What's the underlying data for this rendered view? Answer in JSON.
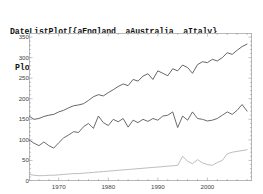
{
  "notebook": {
    "input_code_lines": [
      "DateListPlot[{aEngland, aAustralia, aItaly},",
      "PlotStyle → {Red, Green, Blue}, Joined → True]"
    ],
    "function_name": "DateListPlot",
    "series_symbols": [
      "aEngland",
      "aAustralia",
      "aItaly"
    ],
    "plot_style_colors": [
      "Red",
      "Green",
      "Blue"
    ],
    "joined_option": "True"
  },
  "chart_data": {
    "type": "line",
    "title": "",
    "xlabel": "",
    "ylabel": "",
    "xlim": [
      1964,
      2009
    ],
    "ylim": [
      0,
      360
    ],
    "grid": false,
    "legend_position": "none",
    "yticks": [
      0,
      50,
      100,
      150,
      200,
      250,
      300,
      350
    ],
    "ytick_labels": [
      "0",
      "50",
      "100",
      "150",
      "200",
      "250",
      "300",
      "350"
    ],
    "xticks": [
      1970,
      1980,
      1990,
      2000
    ],
    "xtick_labels": [
      "1970",
      "1980",
      "1990",
      "2000"
    ],
    "x": [
      1964,
      1965,
      1966,
      1967,
      1968,
      1969,
      1970,
      1971,
      1972,
      1973,
      1974,
      1975,
      1976,
      1977,
      1978,
      1979,
      1980,
      1981,
      1982,
      1983,
      1984,
      1985,
      1986,
      1987,
      1988,
      1989,
      1990,
      1991,
      1992,
      1993,
      1994,
      1995,
      1996,
      1997,
      1998,
      1999,
      2000,
      2001,
      2002,
      2003,
      2004,
      2005,
      2006,
      2007,
      2008
    ],
    "series": [
      {
        "name": "aEngland",
        "color_name": "Red",
        "color": "#555555",
        "values": [
          158,
          150,
          152,
          157,
          160,
          162,
          168,
          172,
          178,
          183,
          185,
          188,
          196,
          205,
          210,
          207,
          215,
          222,
          230,
          236,
          232,
          247,
          243,
          255,
          261,
          247,
          268,
          262,
          256,
          273,
          268,
          282,
          276,
          262,
          283,
          290,
          288,
          296,
          292,
          300,
          312,
          308,
          318,
          327,
          333
        ]
      },
      {
        "name": "aAustralia",
        "color_name": "Green",
        "color": "#5a5a5a",
        "values": [
          100,
          92,
          86,
          95,
          86,
          80,
          93,
          105,
          112,
          120,
          118,
          132,
          140,
          128,
          158,
          142,
          135,
          150,
          144,
          152,
          131,
          148,
          142,
          150,
          145,
          152,
          148,
          158,
          160,
          168,
          130,
          158,
          148,
          168,
          152,
          150,
          146,
          148,
          152,
          160,
          168,
          162,
          172,
          186,
          170
        ]
      },
      {
        "name": "aItaly",
        "color_name": "Blue",
        "color": "#b5b5b5",
        "values": [
          16,
          14,
          13,
          13,
          14,
          14,
          15,
          16,
          17,
          18,
          18,
          19,
          20,
          21,
          22,
          23,
          24,
          25,
          26,
          27,
          28,
          29,
          30,
          31,
          32,
          33,
          34,
          35,
          36,
          37,
          38,
          60,
          48,
          42,
          52,
          44,
          40,
          38,
          45,
          50,
          66,
          70,
          72,
          74,
          76
        ]
      }
    ]
  }
}
